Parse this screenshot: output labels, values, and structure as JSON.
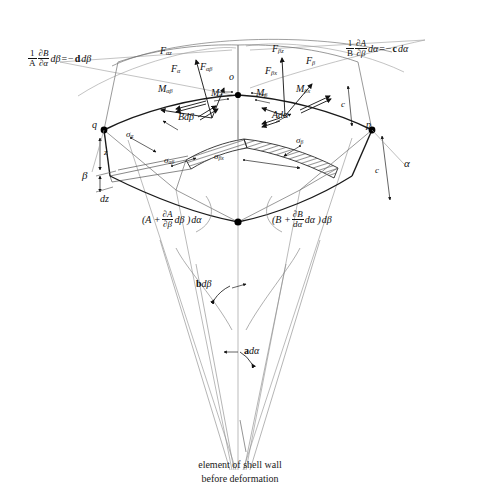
{
  "figure": {
    "title_caption_line1": "element of shell wall",
    "title_caption_line2": "before deformation",
    "domain": "engineering-diagram"
  },
  "formulas": {
    "left": {
      "frac_num": "1",
      "frac_num_partial": "∂B",
      "frac_den": "A",
      "frac_den_partial": "∂α",
      "tail": "dβ",
      "equals": "=",
      "rhs_sign": "−",
      "rhs_bold": "d",
      "rhs_tail": "dβ",
      "full": "1/A ∂B/∂α dβ = − d dβ"
    },
    "right": {
      "frac_num": "1",
      "frac_num_partial": "∂A",
      "frac_den": "B",
      "frac_den_partial": "∂β",
      "tail": "dα",
      "equals": "=",
      "rhs_sign": "−",
      "rhs_bold": "c",
      "rhs_tail": "dα",
      "full": "1/B ∂A/∂β dα = − c dα"
    },
    "bottom_left": {
      "open": "(A +",
      "frac_num": "∂A",
      "frac_den": "∂β",
      "mid": "dβ )",
      "close": "dα",
      "full": "(A + ∂A/∂β dβ) dα"
    },
    "bottom_right": {
      "open": "(B +",
      "frac_num": "∂B",
      "frac_den": "dα",
      "mid": "dα )",
      "close": "dβ",
      "full": "(B + ∂B/dα dα) dβ"
    }
  },
  "forces": {
    "alpha_z": "F",
    "alpha_z_sub": "αz",
    "alpha": "F",
    "alpha_sub": "α",
    "alpha_beta": "F",
    "alpha_beta_sub": "αβ",
    "beta_z": "F",
    "beta_z_sub": "βz",
    "beta": "F",
    "beta_sub": "β",
    "beta_x": "F",
    "beta_x_sub": "βx"
  },
  "moments": {
    "m_alpha_beta": "M",
    "m_alpha_beta_sub": "αβ",
    "m_alpha": "M",
    "m_alpha_sub": "α",
    "m_beta": "M",
    "m_beta_sub": "β",
    "m_beta_x": "M",
    "m_beta_x_sub": "βx"
  },
  "stresses": {
    "sigma_alpha": "σ",
    "sigma_alpha_sub": "α",
    "sigma_alpha_beta": "σ",
    "sigma_alpha_beta_sub": "αβ",
    "sigma_beta_x": "σ",
    "sigma_beta_x_sub": "βx",
    "sigma_beta": "σ",
    "sigma_beta_sub": "β"
  },
  "dimensions": {
    "b_d_beta_bold": "b",
    "b_d_beta_tail": "dβ",
    "a_d_alpha_bold": "a",
    "a_d_alpha_tail": "dα",
    "bd_beta_edge": "Bdβ",
    "ad_alpha_edge": "Adα",
    "z": "z",
    "dz": "dz",
    "c_upper": "c",
    "c_lower": "c"
  },
  "points": {
    "o": "o",
    "p": "p",
    "q": "q"
  },
  "axes": {
    "alpha": "α",
    "beta": "β"
  },
  "colors": {
    "ink": "#1a1a1a",
    "thin_line": "#8a8a8a",
    "mid_line": "#555555",
    "hatch": "#444444",
    "paper": "#ffffff"
  }
}
